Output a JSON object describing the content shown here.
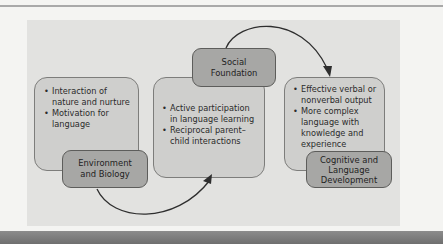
{
  "diagram": {
    "colors": {
      "panel": "#e2e2e0",
      "content_box": "#cfcfcd",
      "label_box": "#a7a7a5",
      "arrow": "#2e2e2e"
    },
    "stages": [
      {
        "label": "Environment and Biology",
        "label_lines": [
          "Environment",
          "and Biology"
        ],
        "bullets": [
          "Interaction of nature and nurture",
          "Motivation for language"
        ]
      },
      {
        "label": "Social Foundation",
        "label_lines": [
          "Social",
          "Foundation"
        ],
        "bullets": [
          "Active participation in language learning",
          "Reciprocal parent–child interactions"
        ]
      },
      {
        "label": "Cognitive and Language Development",
        "label_lines": [
          "Cognitive and",
          "Language",
          "Development"
        ],
        "bullets": [
          "Effective verbal or nonverbal output",
          "More complex language with knowledge and experience"
        ]
      }
    ],
    "arrows": [
      {
        "from": "Environment and Biology",
        "to": "Social Foundation",
        "icon": "curved-arrow-icon"
      },
      {
        "from": "Social Foundation",
        "to": "Cognitive and Language Development",
        "icon": "curved-arrow-icon"
      }
    ]
  }
}
